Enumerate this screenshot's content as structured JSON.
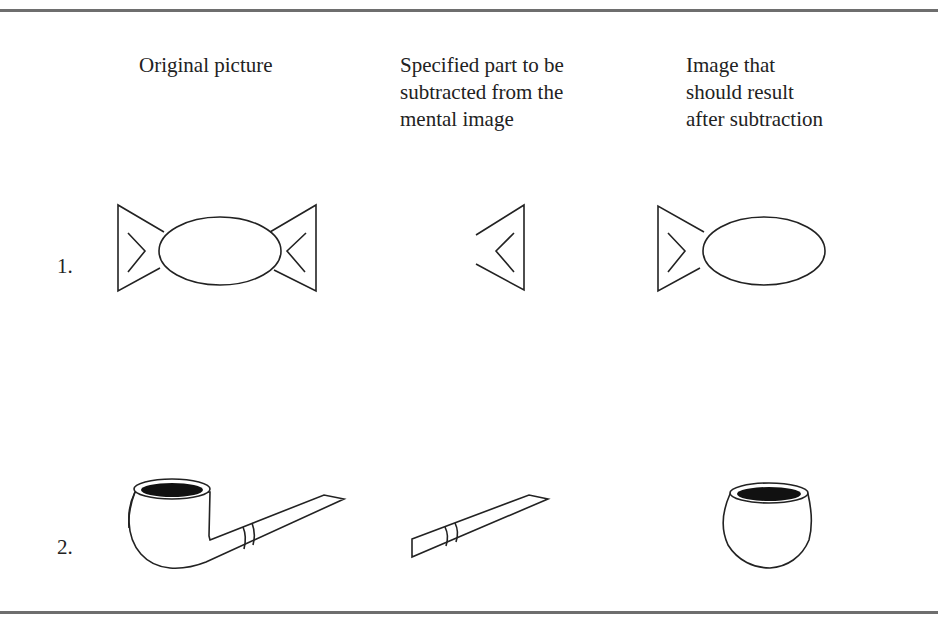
{
  "columns": [
    {
      "lines": [
        "Original picture"
      ]
    },
    {
      "lines": [
        "Specified part to be",
        "subtracted from the",
        "mental image"
      ]
    },
    {
      "lines": [
        "Image that",
        "should result",
        "after subtraction"
      ]
    }
  ],
  "rows": [
    {
      "label": "1.",
      "original": "candy",
      "part": "right-wrapper-end",
      "result": "fish"
    },
    {
      "label": "2.",
      "original": "pipe",
      "part": "pipe-stem",
      "result": "pipe-bowl"
    }
  ]
}
